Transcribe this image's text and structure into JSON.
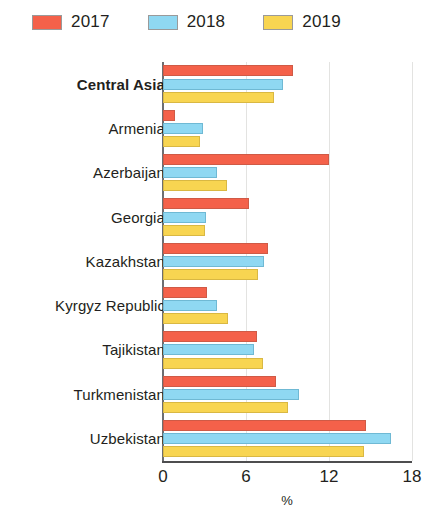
{
  "legend": {
    "items": [
      {
        "label": "2017",
        "color": "#f4614a",
        "key": "s2017"
      },
      {
        "label": "2018",
        "color": "#8fd8f2",
        "key": "s2018"
      },
      {
        "label": "2019",
        "color": "#f8d551",
        "key": "s2019"
      }
    ]
  },
  "axis": {
    "ticks": [
      "0",
      "6",
      "12",
      "18"
    ],
    "title": "%"
  },
  "chart_data": {
    "type": "bar",
    "orientation": "horizontal",
    "title": "",
    "subtitle": "",
    "xlabel": "%",
    "ylabel": "",
    "xlim": [
      0,
      18
    ],
    "xticks": [
      0,
      6,
      12,
      18
    ],
    "grid": true,
    "legend_position": "top-left",
    "categories": [
      "Central Asia",
      "Armenia",
      "Azerbaijan",
      "Georgia",
      "Kazakhstan",
      "Kyrgyz Republic",
      "Tajikistan",
      "Turkmenistan",
      "Uzbekistan"
    ],
    "highlighted_categories": [
      "Central Asia"
    ],
    "series": [
      {
        "name": "2017",
        "color": "#f4614a",
        "values": [
          9.4,
          0.9,
          12.0,
          6.2,
          7.6,
          3.2,
          6.8,
          8.2,
          14.7
        ]
      },
      {
        "name": "2018",
        "color": "#8fd8f2",
        "values": [
          8.7,
          2.9,
          3.9,
          3.1,
          7.3,
          3.9,
          6.6,
          9.8,
          16.5
        ]
      },
      {
        "name": "2019",
        "color": "#f8d551",
        "values": [
          8.0,
          2.7,
          4.6,
          3.0,
          6.9,
          4.7,
          7.2,
          9.0,
          14.5
        ]
      }
    ]
  }
}
